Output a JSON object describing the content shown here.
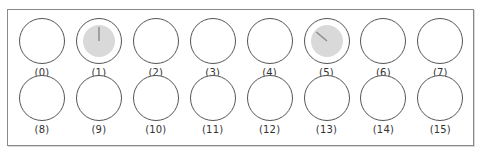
{
  "panel": {
    "border_color": "#8a8a8a",
    "fill_color": "#d9d9d9",
    "needle_color": "#8c8c8c",
    "channels": [
      {
        "label": "(0)",
        "active": false
      },
      {
        "label": "(1)",
        "active": true,
        "needle_angle_deg": 0
      },
      {
        "label": "(2)",
        "active": false
      },
      {
        "label": "(3)",
        "active": false
      },
      {
        "label": "(4)",
        "active": false
      },
      {
        "label": "(5)",
        "active": true,
        "needle_angle_deg": -50
      },
      {
        "label": "(6)",
        "active": false
      },
      {
        "label": "(7)",
        "active": false
      },
      {
        "label": "(8)",
        "active": false
      },
      {
        "label": "(9)",
        "active": false
      },
      {
        "label": "(10)",
        "active": false
      },
      {
        "label": "(11)",
        "active": false
      },
      {
        "label": "(12)",
        "active": false
      },
      {
        "label": "(13)",
        "active": false
      },
      {
        "label": "(14)",
        "active": false
      },
      {
        "label": "(15)",
        "active": false
      }
    ]
  }
}
